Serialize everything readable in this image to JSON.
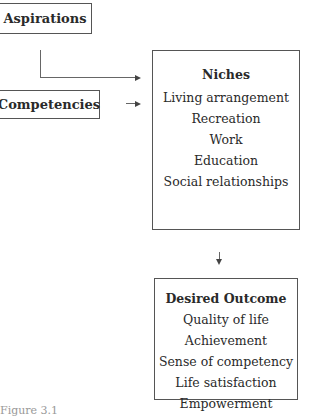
{
  "diagram": {
    "aspirations": {
      "label": "Aspirations"
    },
    "competencies": {
      "label": "Competencies"
    },
    "niches": {
      "title": "Niches",
      "items": [
        "Living arrangement",
        "Recreation",
        "Work",
        "Education",
        "Social relationships"
      ]
    },
    "desired_outcome": {
      "title": "Desired Outcome",
      "items": [
        "Quality of life",
        "Achievement",
        "Sense of competency",
        "Life satisfaction",
        "Empowerment"
      ]
    }
  },
  "caption": "Figure 3.1"
}
